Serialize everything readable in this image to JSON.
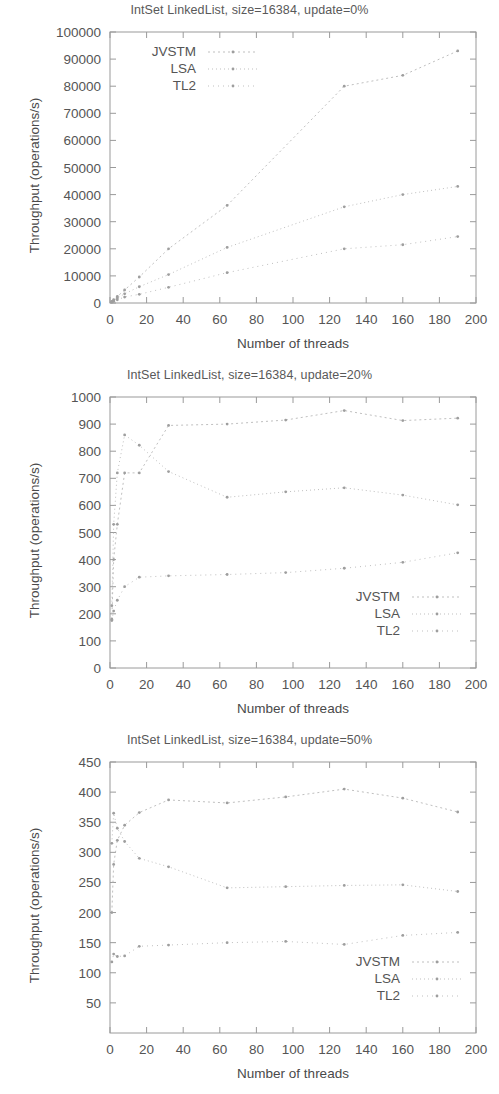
{
  "figures": [
    {
      "id": "fig-update-0",
      "title": "IntSet LinkedList, size=16384, update=0%",
      "xlabel": "Number of threads",
      "ylabel": "Throughput (operations/s)",
      "legend_position": "top-left",
      "legend": [
        "JVSTM",
        "LSA",
        "TL2"
      ],
      "chart_data": {
        "type": "line",
        "title": "IntSet LinkedList, size=16384, update=0%",
        "xlabel": "Number of threads",
        "ylabel": "Throughput (operations/s)",
        "xlim": [
          0,
          200
        ],
        "ylim": [
          0,
          100000
        ],
        "xticks": [
          0,
          20,
          40,
          60,
          80,
          100,
          120,
          140,
          160,
          180,
          200
        ],
        "yticks": [
          0,
          10000,
          20000,
          30000,
          40000,
          50000,
          60000,
          70000,
          80000,
          90000,
          100000
        ],
        "grid": false,
        "legend_position": "upper left",
        "series": [
          {
            "name": "JVSTM",
            "x": [
              1,
              2,
              4,
              8,
              16,
              32,
              64,
              128,
              160,
              190
            ],
            "y": [
              600,
              1200,
              2400,
              4800,
              9600,
              20000,
              36000,
              80000,
              84000,
              93000
            ]
          },
          {
            "name": "LSA",
            "x": [
              1,
              2,
              4,
              8,
              16,
              32,
              64,
              128,
              160,
              190
            ],
            "y": [
              400,
              900,
              1800,
              3400,
              6000,
              10500,
              20500,
              35500,
              40000,
              43000
            ]
          },
          {
            "name": "TL2",
            "x": [
              1,
              2,
              4,
              8,
              16,
              32,
              64,
              128,
              160,
              190
            ],
            "y": [
              300,
              600,
              1200,
              2200,
              3200,
              5800,
              11200,
              20000,
              21500,
              24500
            ]
          }
        ]
      }
    },
    {
      "id": "fig-update-20",
      "title": "IntSet LinkedList, size=16384, update=20%",
      "xlabel": "Number of threads",
      "ylabel": "Throughput (operations/s)",
      "legend_position": "bottom-right",
      "legend": [
        "JVSTM",
        "LSA",
        "TL2"
      ],
      "chart_data": {
        "type": "line",
        "title": "IntSet LinkedList, size=16384, update=20%",
        "xlabel": "Number of threads",
        "ylabel": "Throughput (operations/s)",
        "xlim": [
          0,
          200
        ],
        "ylim": [
          0,
          1000
        ],
        "xticks": [
          0,
          20,
          40,
          60,
          80,
          100,
          120,
          140,
          160,
          180,
          200
        ],
        "yticks": [
          0,
          100,
          200,
          300,
          400,
          500,
          600,
          700,
          800,
          900,
          1000
        ],
        "grid": false,
        "legend_position": "lower right",
        "series": [
          {
            "name": "JVSTM",
            "x": [
              1,
              2,
              4,
              8,
              16,
              32,
              64,
              96,
              128,
              160,
              190
            ],
            "y": [
              180,
              400,
              530,
              720,
              720,
              895,
              900,
              915,
              950,
              913,
              922
            ]
          },
          {
            "name": "LSA",
            "x": [
              1,
              2,
              4,
              8,
              16,
              32,
              64,
              96,
              128,
              160,
              190
            ],
            "y": [
              230,
              530,
              720,
              860,
              822,
              725,
              630,
              650,
              665,
              638,
              602
            ]
          },
          {
            "name": "TL2",
            "x": [
              1,
              2,
              4,
              8,
              16,
              32,
              64,
              96,
              128,
              160,
              190
            ],
            "y": [
              175,
              210,
              250,
              300,
              335,
              340,
              345,
              352,
              368,
              390,
              425
            ]
          }
        ]
      }
    },
    {
      "id": "fig-update-50",
      "title": "IntSet LinkedList, size=16384, update=50%",
      "xlabel": "Number of threads",
      "ylabel": "Throughput (operations/s)",
      "legend_position": "bottom-right",
      "legend": [
        "JVSTM",
        "LSA",
        "TL2"
      ],
      "chart_data": {
        "type": "line",
        "title": "IntSet LinkedList, size=16384, update=50%",
        "xlabel": "Number of threads",
        "ylabel": "Throughput (operations/s)",
        "xlim": [
          0,
          200
        ],
        "ylim": [
          0,
          450
        ],
        "xticks": [
          0,
          20,
          40,
          60,
          80,
          100,
          120,
          140,
          160,
          180,
          200
        ],
        "yticks": [
          50,
          100,
          150,
          200,
          250,
          300,
          350,
          400,
          450
        ],
        "grid": false,
        "legend_position": "lower right",
        "series": [
          {
            "name": "JVSTM",
            "x": [
              1,
              2,
              4,
              8,
              16,
              32,
              64,
              96,
              128,
              160,
              190
            ],
            "y": [
              200,
              280,
              320,
              345,
              366,
              387,
              382,
              392,
              405,
              390,
              367
            ]
          },
          {
            "name": "LSA",
            "x": [
              1,
              2,
              4,
              8,
              16,
              32,
              64,
              96,
              128,
              160,
              190
            ],
            "y": [
              315,
              365,
              340,
              318,
              290,
              276,
              241,
              243,
              245,
              246,
              235
            ]
          },
          {
            "name": "TL2",
            "x": [
              1,
              2,
              4,
              8,
              16,
              32,
              64,
              96,
              128,
              160,
              190
            ],
            "y": [
              118,
              131,
              127,
              128,
              144,
              146,
              150,
              152,
              147,
              162,
              167
            ]
          }
        ]
      }
    }
  ]
}
